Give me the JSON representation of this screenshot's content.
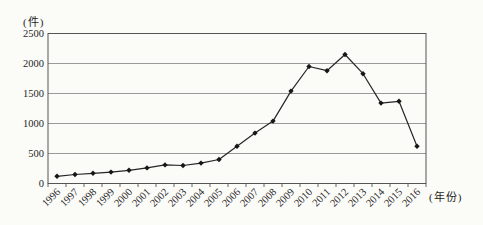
{
  "figure": {
    "background": "#fbfbf8",
    "ink_color": "#262626",
    "marker_color": "#161616",
    "grid_color": "#8f8f8f",
    "border_color": "#555555"
  },
  "chart_data": {
    "type": "line",
    "title": "",
    "ylabel": "(件)",
    "xlabel": "(年份)",
    "categories": [
      "1996",
      "1997",
      "1998",
      "1999",
      "2000",
      "2001",
      "2002",
      "2003",
      "2004",
      "2005",
      "2006",
      "2007",
      "2008",
      "2009",
      "2010",
      "2011",
      "2012",
      "2013",
      "2014",
      "2015",
      "2016"
    ],
    "values": [
      120,
      150,
      170,
      190,
      220,
      260,
      310,
      300,
      340,
      400,
      620,
      840,
      1040,
      1540,
      1950,
      1880,
      2150,
      1830,
      1340,
      1370,
      620
    ],
    "ylim": [
      0,
      2500
    ],
    "ytick_step": 500,
    "yticks": [
      0,
      500,
      1000,
      1500,
      2000,
      2500
    ],
    "grid": true,
    "legend_position": "none",
    "marker": "diamond",
    "x_label_rotation": -45
  }
}
